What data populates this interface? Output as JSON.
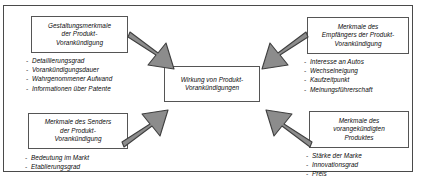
{
  "diagram": {
    "frame_color": "#4a4a4a",
    "box_border_color": "#555555",
    "arrow_fill": "#8c8c8c",
    "arrow_stroke": "#3f3f3f",
    "center": {
      "title": "Wirkung von Produkt-\nVorankündigungen"
    },
    "nodes": [
      {
        "id": "design-features",
        "title": "Gestaltungsmerkmale\nder Produkt-\nVorankündigung",
        "bullets": [
          "Detaillierungsgrad",
          "Vorankündigungsdauer",
          "Wahrgenommener Aufwand",
          "Informationen über Patente"
        ]
      },
      {
        "id": "receiver-features",
        "title": "Merkmale des\nEmpfängers der Produkt-\nVorankündigung",
        "bullets": [
          "Interesse an Autos",
          "Wechselneigung",
          "Kaufzeitpunkt",
          "Meinungsführerschaft"
        ]
      },
      {
        "id": "sender-features",
        "title": "Merkmale des Senders\nder Produkt-\nVorankündigung",
        "bullets": [
          "Bedeutung im Markt",
          "Etablierungsgrad"
        ]
      },
      {
        "id": "product-features",
        "title": "Merkmale des\nvorangekündigten\nProduktes",
        "bullets": [
          "Stärke der Marke",
          "Innovationsgrad",
          "Preis"
        ]
      }
    ],
    "bullet_marker": "-",
    "arrows": [
      {
        "id": "arrow-top-left",
        "direction": "down-right"
      },
      {
        "id": "arrow-top-right",
        "direction": "down-left"
      },
      {
        "id": "arrow-bottom-left",
        "direction": "up-right"
      },
      {
        "id": "arrow-bottom-right",
        "direction": "up-left"
      }
    ]
  }
}
